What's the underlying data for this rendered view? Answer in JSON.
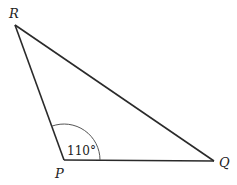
{
  "diagram": {
    "type": "triangle",
    "vertices": [
      {
        "label": "R",
        "x": 15,
        "y": 25,
        "label_x": 9,
        "label_y": 18
      },
      {
        "label": "P",
        "x": 64,
        "y": 160,
        "label_x": 55,
        "label_y": 178
      },
      {
        "label": "Q",
        "x": 214,
        "y": 161,
        "label_x": 219,
        "label_y": 167
      }
    ],
    "angle": {
      "vertex": "P",
      "value_label": "110°",
      "radius": 36,
      "label_x": 67,
      "label_y": 155
    },
    "colors": {
      "stroke": "#2a2a2a",
      "arc": "#555555",
      "text": "#222222"
    }
  }
}
